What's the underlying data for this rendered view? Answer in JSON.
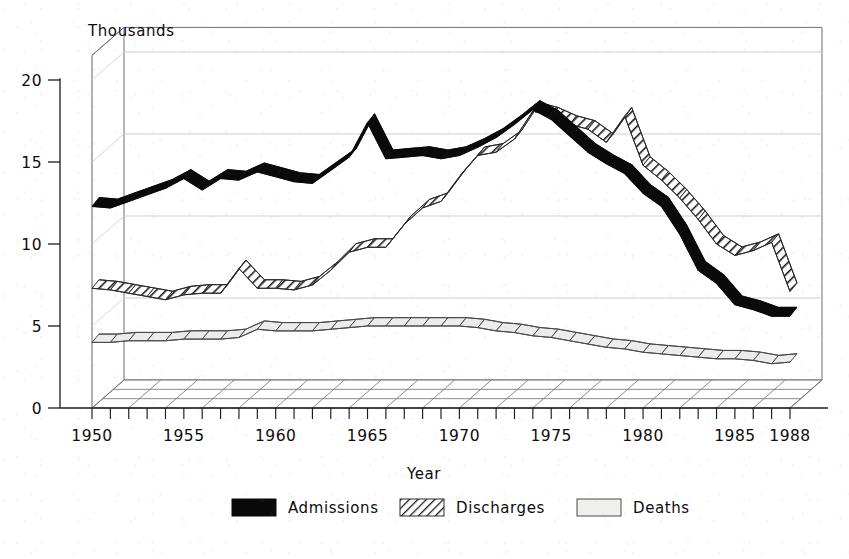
{
  "chart_data": {
    "type": "line",
    "title": "",
    "subtitle": "",
    "unit_label": "Thousands",
    "xlabel": "Year",
    "ylabel": "",
    "ylim": [
      0,
      21.5
    ],
    "xlim": [
      1950,
      1989
    ],
    "grid": true,
    "grid_values": [
      5,
      10,
      15,
      20
    ],
    "legend_position": "bottom",
    "style": "3d-ribbon",
    "y_ticks": [
      "0",
      "5",
      "10",
      "15",
      "20"
    ],
    "y_tick_values": [
      0,
      5,
      10,
      15,
      20
    ],
    "x_ticks": [
      "1950",
      "1955",
      "1960",
      "1965",
      "1970",
      "1975",
      "1980",
      "1985",
      "1988"
    ],
    "x_tick_values": [
      1950,
      1955,
      1960,
      1965,
      1970,
      1975,
      1980,
      1985,
      1988
    ],
    "x": [
      1950,
      1951,
      1952,
      1953,
      1954,
      1955,
      1956,
      1957,
      1958,
      1959,
      1960,
      1961,
      1962,
      1963,
      1964,
      1965,
      1966,
      1967,
      1968,
      1969,
      1970,
      1971,
      1972,
      1973,
      1974,
      1975,
      1976,
      1977,
      1978,
      1979,
      1980,
      1981,
      1982,
      1983,
      1984,
      1985,
      1986,
      1987,
      1988
    ],
    "series": [
      {
        "name": "Admissions",
        "color": "#000000",
        "fill": "solid-black",
        "values": [
          12.3,
          12.2,
          12.6,
          13.0,
          13.4,
          14.0,
          13.3,
          14.0,
          13.9,
          14.4,
          14.1,
          13.8,
          13.7,
          14.5,
          15.3,
          17.4,
          15.2,
          15.3,
          15.4,
          15.2,
          15.4,
          15.9,
          16.5,
          17.3,
          18.2,
          17.6,
          16.6,
          15.6,
          14.9,
          14.3,
          13.1,
          12.3,
          10.6,
          8.4,
          7.6,
          6.3,
          6.0,
          5.6,
          5.6
        ]
      },
      {
        "name": "Discharges",
        "color": "#000000",
        "fill": "diagonal-hatch",
        "values": [
          7.3,
          7.2,
          7.0,
          6.8,
          6.6,
          6.9,
          7.0,
          7.0,
          8.5,
          7.3,
          7.3,
          7.2,
          7.5,
          8.4,
          9.5,
          9.8,
          9.8,
          11.2,
          12.2,
          12.6,
          14.1,
          15.4,
          15.6,
          16.4,
          18.1,
          17.8,
          17.3,
          17.0,
          16.2,
          17.8,
          14.8,
          13.9,
          12.8,
          11.5,
          10.0,
          9.3,
          9.6,
          10.1,
          7.1
        ]
      },
      {
        "name": "Deaths",
        "color": "#000000",
        "fill": "light-gray",
        "values": [
          4.0,
          4.0,
          4.1,
          4.1,
          4.1,
          4.2,
          4.2,
          4.2,
          4.3,
          4.8,
          4.7,
          4.7,
          4.7,
          4.8,
          4.9,
          5.0,
          5.0,
          5.0,
          5.0,
          5.0,
          5.0,
          4.9,
          4.7,
          4.6,
          4.4,
          4.3,
          4.1,
          3.9,
          3.7,
          3.6,
          3.4,
          3.3,
          3.2,
          3.1,
          3.0,
          3.0,
          2.9,
          2.7,
          2.8
        ]
      }
    ]
  },
  "legend": {
    "items": [
      {
        "label": "Admissions",
        "swatch": "solid-black"
      },
      {
        "label": "Discharges",
        "swatch": "diagonal-hatch"
      },
      {
        "label": "Deaths",
        "swatch": "light-gray"
      }
    ]
  }
}
